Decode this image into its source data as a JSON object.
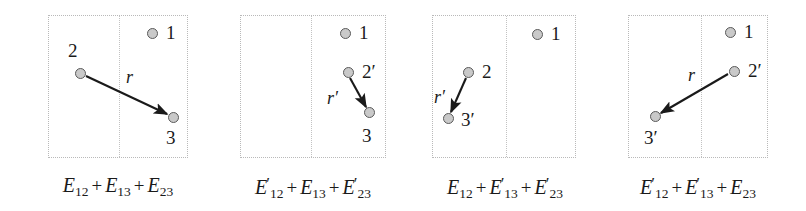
{
  "figure": {
    "type": "diagram",
    "panels": [
      {
        "id": "panel-1",
        "caption_plain": "E12 + E13 + E23",
        "caption_terms": [
          {
            "base": "E",
            "prime": "",
            "sub": "12"
          },
          {
            "base": "E",
            "prime": "",
            "sub": "13"
          },
          {
            "base": "E",
            "prime": "",
            "sub": "23"
          }
        ],
        "box": {
          "x": 48,
          "y": 15,
          "width": 140,
          "height": 143,
          "divider_x": 70
        },
        "nodes": [
          {
            "name": "node-1",
            "label": "1",
            "prime": "",
            "cx": 152,
            "cy": 33,
            "label_x": 166,
            "label_y": 23
          },
          {
            "name": "node-2",
            "label": "2",
            "prime": "",
            "cx": 80,
            "cy": 73,
            "label_x": 68,
            "label_y": 41
          },
          {
            "name": "node-3",
            "label": "3",
            "prime": "",
            "cx": 173,
            "cy": 117,
            "label_x": 166,
            "label_y": 128
          }
        ],
        "arrow": {
          "x1": 86,
          "y1": 76,
          "x2": 167,
          "y2": 114,
          "label": "r",
          "prime": "",
          "label_x": 126,
          "label_y": 68
        }
      },
      {
        "id": "panel-2",
        "caption_plain": "E'12 + E13 + E'23",
        "caption_terms": [
          {
            "base": "E",
            "prime": "′",
            "sub": "12"
          },
          {
            "base": "E",
            "prime": "",
            "sub": "13"
          },
          {
            "base": "E",
            "prime": "′",
            "sub": "23"
          }
        ],
        "box": {
          "x": 240,
          "y": 15,
          "width": 146,
          "height": 143,
          "divider_x": 70
        },
        "nodes": [
          {
            "name": "node-1",
            "label": "1",
            "prime": "",
            "cx": 345,
            "cy": 33,
            "label_x": 359,
            "label_y": 23
          },
          {
            "name": "node-2-prime",
            "label": "2",
            "prime": "′",
            "cx": 348,
            "cy": 72,
            "label_x": 362,
            "label_y": 62
          },
          {
            "name": "node-3",
            "label": "3",
            "prime": "",
            "cx": 369,
            "cy": 112,
            "label_x": 362,
            "label_y": 126
          }
        ],
        "arrow": {
          "x1": 350,
          "y1": 78,
          "x2": 366,
          "y2": 107,
          "label": "r",
          "prime": "′",
          "label_x": 327,
          "label_y": 89
        }
      },
      {
        "id": "panel-3",
        "caption_plain": "E12 + E'13 + E'23",
        "caption_terms": [
          {
            "base": "E",
            "prime": "",
            "sub": "12"
          },
          {
            "base": "E",
            "prime": "′",
            "sub": "13"
          },
          {
            "base": "E",
            "prime": "′",
            "sub": "23"
          }
        ],
        "box": {
          "x": 432,
          "y": 15,
          "width": 144,
          "height": 143,
          "divider_x": 73
        },
        "nodes": [
          {
            "name": "node-1",
            "label": "1",
            "prime": "",
            "cx": 537,
            "cy": 34,
            "label_x": 551,
            "label_y": 24
          },
          {
            "name": "node-2",
            "label": "2",
            "prime": "",
            "cx": 468,
            "cy": 72,
            "label_x": 482,
            "label_y": 62
          },
          {
            "name": "node-3-prime",
            "label": "3",
            "prime": "′",
            "cx": 448,
            "cy": 118,
            "label_x": 461,
            "label_y": 110
          }
        ],
        "arrow": {
          "x1": 466,
          "y1": 78,
          "x2": 451,
          "y2": 112,
          "label": "r",
          "prime": "′",
          "label_x": 434,
          "label_y": 88
        }
      },
      {
        "id": "panel-4",
        "caption_plain": "E'12 + E'13 + E23",
        "caption_terms": [
          {
            "base": "E",
            "prime": "′",
            "sub": "12"
          },
          {
            "base": "E",
            "prime": "′",
            "sub": "13"
          },
          {
            "base": "E",
            "prime": "",
            "sub": "23"
          }
        ],
        "box": {
          "x": 628,
          "y": 15,
          "width": 140,
          "height": 143,
          "divider_x": 72
        },
        "nodes": [
          {
            "name": "node-1",
            "label": "1",
            "prime": "",
            "cx": 730,
            "cy": 32,
            "label_x": 744,
            "label_y": 22
          },
          {
            "name": "node-2-prime",
            "label": "2",
            "prime": "′",
            "cx": 734,
            "cy": 71,
            "label_x": 748,
            "label_y": 61
          },
          {
            "name": "node-3-prime",
            "label": "3",
            "prime": "′",
            "cx": 655,
            "cy": 116,
            "label_x": 644,
            "label_y": 128
          }
        ],
        "arrow": {
          "x1": 728,
          "y1": 74,
          "x2": 661,
          "y2": 113,
          "label": "r",
          "prime": "",
          "label_x": 688,
          "label_y": 66
        }
      }
    ],
    "caption_positions": [
      {
        "panel": "panel-1",
        "x": 118,
        "y": 175
      },
      {
        "panel": "panel-2",
        "x": 313,
        "y": 175
      },
      {
        "panel": "panel-3",
        "x": 505,
        "y": 175
      },
      {
        "panel": "panel-4",
        "x": 698,
        "y": 175
      }
    ],
    "colors": {
      "dot_fill": "#c9c9c9",
      "dot_stroke": "#5a5a5a",
      "box_border": "#b9b9b9",
      "divider": "#c2c2c2",
      "arrow": "#1a1a1a",
      "text": "#1a1a1a",
      "background": "#ffffff"
    }
  }
}
